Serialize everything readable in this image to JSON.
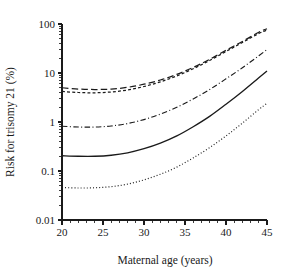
{
  "chart_data": {
    "type": "line",
    "title": "",
    "xlabel": "Maternal age  (years)",
    "ylabel": "Risk for trisomy 21 (%)",
    "xlim": [
      20,
      45
    ],
    "ylim": [
      0.01,
      100
    ],
    "yscale": "log",
    "xscale": "linear",
    "grid": false,
    "legend": "none",
    "x_ticks": [
      "20",
      "25",
      "30",
      "35",
      "40",
      "45"
    ],
    "x_tick_values": [
      20,
      25,
      30,
      35,
      40,
      45
    ],
    "x_minor_interval": 1,
    "y_ticks": [
      "100",
      "10",
      "1",
      "0.1",
      "0.01"
    ],
    "y_tick_values": [
      100,
      10,
      1,
      0.1,
      0.01
    ],
    "x": [
      20,
      22,
      24,
      26,
      28,
      30,
      32,
      34,
      36,
      38,
      40,
      42,
      44,
      45
    ],
    "series": [
      {
        "name": "upper-long-dash",
        "style": "long-dash",
        "values": [
          5.0,
          4.7,
          4.6,
          4.7,
          5.1,
          5.9,
          7.2,
          9.4,
          13.0,
          19.0,
          29.0,
          44.0,
          68.0,
          80.0
        ]
      },
      {
        "name": "upper-short-dash",
        "style": "short-dash",
        "values": [
          4.2,
          4.0,
          3.95,
          4.1,
          4.5,
          5.3,
          6.6,
          8.7,
          12.2,
          18.0,
          27.5,
          42.0,
          64.0,
          75.0
        ]
      },
      {
        "name": "middle-dash-dot",
        "style": "dash-dot",
        "values": [
          0.82,
          0.79,
          0.79,
          0.83,
          0.93,
          1.12,
          1.45,
          2.0,
          2.95,
          4.6,
          7.6,
          12.8,
          22.5,
          30.0
        ]
      },
      {
        "name": "central-solid",
        "style": "solid",
        "values": [
          0.205,
          0.2,
          0.2,
          0.21,
          0.235,
          0.285,
          0.37,
          0.52,
          0.8,
          1.3,
          2.3,
          4.2,
          8.0,
          11.0
        ]
      },
      {
        "name": "lower-dotted",
        "style": "dotted",
        "values": [
          0.046,
          0.045,
          0.0455,
          0.048,
          0.054,
          0.066,
          0.086,
          0.12,
          0.185,
          0.3,
          0.52,
          0.95,
          1.8,
          2.4
        ]
      }
    ]
  }
}
